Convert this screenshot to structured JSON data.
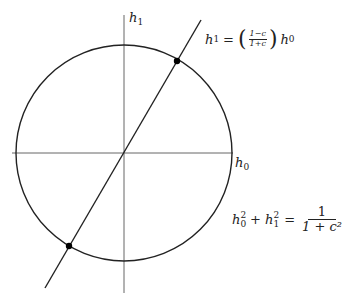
{
  "axes": {
    "vertical_label": "h",
    "vertical_sub": "1",
    "horizontal_label": "h",
    "horizontal_sub": "0"
  },
  "line_equation": {
    "lhs_var": "h",
    "lhs_sub": "1",
    "eq": "=",
    "frac_num": "1−c",
    "frac_den": "1+c",
    "lparen": "(",
    "rparen": ")",
    "rhs_var": "h",
    "rhs_sub": "0"
  },
  "circle_equation": {
    "t1_var": "h",
    "t1_sub": "0",
    "t1_sup": "2",
    "plus": "+",
    "t2_var": "h",
    "t2_sub": "1",
    "t2_sup": "2",
    "eq": "=",
    "frac_num": "1",
    "frac_den": "1 + c²"
  },
  "geometry": {
    "center": [
      124,
      153
    ],
    "radius": 108,
    "line_start": [
      45,
      288
    ],
    "line_end": [
      201,
      20
    ],
    "intersections": [
      [
        177,
        61
      ],
      [
        69,
        246
      ]
    ],
    "colors": {
      "circle": "#222222",
      "axes": "#555555",
      "line": "#222222"
    }
  }
}
